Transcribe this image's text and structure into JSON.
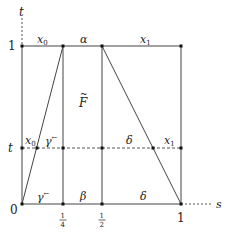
{
  "diagram": {
    "axes": {
      "vertical_label": "t",
      "horizontal_label": "s"
    },
    "ticks": {
      "y_top": "1",
      "y_mid": "t",
      "origin": "0",
      "x_quarter_num": "1",
      "x_quarter_den": "4",
      "x_half_num": "1",
      "x_half_den": "2",
      "x_one": "1"
    },
    "region_labels": {
      "top_left": "x",
      "top_left_sub": "0",
      "top_center": "α",
      "top_right": "x",
      "top_right_sub": "1",
      "center": "F",
      "center_accent": "~",
      "mid_left": "x",
      "mid_left_sub": "0",
      "mid_gamma": "γ",
      "mid_gamma_sup": "←",
      "mid_delta": "δ",
      "mid_right": "x",
      "mid_right_sub": "1",
      "bottom_gamma": "γ",
      "bottom_gamma_sup": "←",
      "bottom_beta": "β",
      "bottom_delta": "δ"
    },
    "colors": {
      "line": "#444444",
      "dashed": "#555555",
      "dot": "#111111"
    }
  }
}
